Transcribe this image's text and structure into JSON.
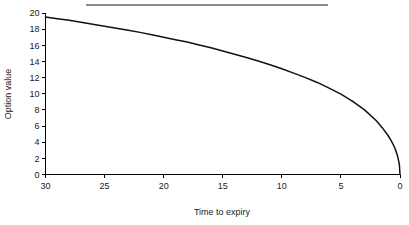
{
  "chart_data": {
    "type": "line",
    "title": "",
    "subtitle": "",
    "xlabel": "Time to expiry",
    "ylabel": "Option value",
    "xlim": [
      30,
      0
    ],
    "ylim": [
      0,
      20
    ],
    "x_axis_reversed": true,
    "grid": false,
    "legend": "none",
    "xticks": [
      30,
      25,
      20,
      15,
      10,
      5,
      0
    ],
    "xtick_labels": [
      "30",
      "25",
      "20",
      "15",
      "10",
      "5",
      "0"
    ],
    "yticks": [
      0,
      2,
      4,
      6,
      8,
      10,
      12,
      14,
      16,
      18,
      20
    ],
    "ytick_labels": [
      "0",
      "2",
      "4",
      "6",
      "8",
      "10",
      "12",
      "14",
      "16",
      "18",
      "20"
    ],
    "series": [
      {
        "name": "Option value",
        "color": "#111111",
        "x": [
          30,
          29,
          28,
          27,
          26,
          25,
          24,
          23,
          22,
          21,
          20,
          19,
          18,
          17,
          16,
          15,
          14,
          13,
          12,
          11,
          10,
          9,
          8,
          7,
          6,
          5,
          4,
          3,
          2,
          1.5,
          1,
          0.75,
          0.5,
          0.35,
          0.2,
          0.1,
          0.05,
          0
        ],
        "y": [
          19.5,
          19.3,
          19.1,
          18.85,
          18.6,
          18.35,
          18.1,
          17.85,
          17.6,
          17.3,
          17.0,
          16.7,
          16.4,
          16.05,
          15.7,
          15.3,
          14.9,
          14.5,
          14.05,
          13.6,
          13.1,
          12.55,
          12.0,
          11.4,
          10.7,
          9.95,
          9.05,
          8.0,
          6.65,
          5.8,
          4.8,
          4.2,
          3.5,
          2.95,
          2.25,
          1.6,
          1.15,
          0
        ]
      }
    ],
    "annotations": [
      {
        "name": "top-rule",
        "type": "horizontal-line",
        "color": "#8c8c8c"
      }
    ],
    "colors": {
      "series": "#111111",
      "axis": "#000000",
      "text": "#1a1a1a",
      "top_rule": "#8c8c8c",
      "background": "#ffffff"
    }
  }
}
